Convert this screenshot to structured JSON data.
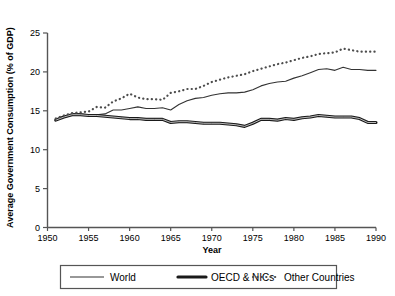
{
  "chart_data": {
    "type": "line",
    "title": "",
    "xlabel": "Year",
    "ylabel": "Average Government Consumption (% of GDP)",
    "xlim": [
      1950,
      1990
    ],
    "ylim": [
      0,
      25
    ],
    "xticks": [
      1950,
      1955,
      1960,
      1965,
      1970,
      1975,
      1980,
      1985,
      1990
    ],
    "yticks": [
      0,
      5,
      10,
      15,
      20,
      25
    ],
    "grid": false,
    "legend_position": "bottom",
    "x": [
      1951,
      1952,
      1953,
      1954,
      1955,
      1956,
      1957,
      1958,
      1959,
      1960,
      1961,
      1962,
      1963,
      1964,
      1965,
      1966,
      1967,
      1968,
      1969,
      1970,
      1971,
      1972,
      1973,
      1974,
      1975,
      1976,
      1977,
      1978,
      1979,
      1980,
      1981,
      1982,
      1983,
      1984,
      1985,
      1986,
      1987,
      1988,
      1989,
      1990
    ],
    "series": [
      {
        "name": "World",
        "style": "thin-solid",
        "color": "#333333",
        "values": [
          13.9,
          14.3,
          14.6,
          14.6,
          14.5,
          14.5,
          14.6,
          15.1,
          15.1,
          15.3,
          15.5,
          15.3,
          15.3,
          15.4,
          15.1,
          15.8,
          16.3,
          16.6,
          16.7,
          17.0,
          17.2,
          17.3,
          17.3,
          17.4,
          17.7,
          18.2,
          18.5,
          18.7,
          18.8,
          19.2,
          19.5,
          19.9,
          20.3,
          20.4,
          20.2,
          20.6,
          20.3,
          20.3,
          20.2,
          20.2
        ]
      },
      {
        "name": "OECD & NICs",
        "style": "thick-solid",
        "color": "#1a1a1a",
        "values": [
          13.8,
          14.2,
          14.5,
          14.5,
          14.4,
          14.4,
          14.3,
          14.2,
          14.1,
          14.0,
          14.0,
          13.9,
          13.9,
          13.9,
          13.5,
          13.6,
          13.6,
          13.5,
          13.4,
          13.4,
          13.4,
          13.3,
          13.2,
          13.0,
          13.4,
          13.9,
          13.9,
          13.8,
          14.0,
          13.9,
          14.1,
          14.2,
          14.4,
          14.3,
          14.2,
          14.2,
          14.2,
          14.0,
          13.5,
          13.5
        ]
      },
      {
        "name": "Other Countries",
        "style": "dotted",
        "color": "#4d4d4d",
        "values": [
          14.0,
          14.4,
          14.7,
          14.8,
          14.9,
          15.5,
          15.4,
          16.2,
          16.6,
          17.2,
          16.7,
          16.5,
          16.5,
          16.4,
          17.3,
          17.5,
          17.8,
          17.8,
          18.2,
          18.7,
          19.0,
          19.3,
          19.5,
          19.7,
          20.1,
          20.4,
          20.7,
          21.0,
          21.2,
          21.5,
          21.8,
          22.0,
          22.3,
          22.4,
          22.5,
          23.0,
          22.8,
          22.6,
          22.6,
          22.6
        ]
      }
    ],
    "legend": [
      {
        "label": "World",
        "style": "thin-solid"
      },
      {
        "label": "OECD & NICs",
        "style": "thick-solid"
      },
      {
        "label": "Other Countries",
        "style": "dotted"
      }
    ]
  }
}
